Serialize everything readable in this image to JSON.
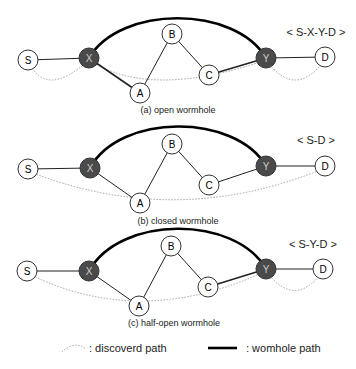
{
  "diagrams": [
    {
      "caption": "(a) open wormhole",
      "route": "< S-X-Y-D >",
      "nodes": {
        "S": {
          "label": "S",
          "x": 28,
          "y": 60,
          "type": "normal"
        },
        "X": {
          "label": "X",
          "x": 89,
          "y": 58,
          "type": "wormhole"
        },
        "A": {
          "label": "A",
          "x": 140,
          "y": 93,
          "type": "normal"
        },
        "B": {
          "label": "B",
          "x": 172,
          "y": 34,
          "type": "normal"
        },
        "C": {
          "label": "C",
          "x": 209,
          "y": 75,
          "type": "normal"
        },
        "Y": {
          "label": "Y",
          "x": 266,
          "y": 58,
          "type": "wormhole"
        },
        "D": {
          "label": "D",
          "x": 325,
          "y": 57,
          "type": "normal"
        }
      },
      "discovered_path": [
        "S",
        "X",
        "Y",
        "D"
      ]
    },
    {
      "caption": "(b) closed wormhole",
      "route": "< S-D >",
      "nodes": {
        "S": {
          "label": "S",
          "x": 28,
          "y": 169,
          "type": "normal"
        },
        "X": {
          "label": "X",
          "x": 90,
          "y": 168,
          "type": "wormhole"
        },
        "A": {
          "label": "A",
          "x": 140,
          "y": 203,
          "type": "normal"
        },
        "B": {
          "label": "B",
          "x": 172,
          "y": 144,
          "type": "normal"
        },
        "C": {
          "label": "C",
          "x": 209,
          "y": 185,
          "type": "normal"
        },
        "Y": {
          "label": "Y",
          "x": 266,
          "y": 166,
          "type": "wormhole"
        },
        "D": {
          "label": "D",
          "x": 325,
          "y": 166,
          "type": "normal"
        }
      },
      "discovered_path": [
        "S",
        "D"
      ]
    },
    {
      "caption": "(c) half-open wormhole",
      "route": "< S-Y-D >",
      "nodes": {
        "S": {
          "label": "S",
          "x": 27,
          "y": 271,
          "type": "normal"
        },
        "X": {
          "label": "X",
          "x": 89,
          "y": 271,
          "type": "wormhole"
        },
        "A": {
          "label": "A",
          "x": 139,
          "y": 306,
          "type": "normal"
        },
        "B": {
          "label": "B",
          "x": 171,
          "y": 246,
          "type": "normal"
        },
        "C": {
          "label": "C",
          "x": 208,
          "y": 287,
          "type": "normal"
        },
        "Y": {
          "label": "Y",
          "x": 266,
          "y": 269,
          "type": "wormhole"
        },
        "D": {
          "label": "D",
          "x": 323,
          "y": 269,
          "type": "normal"
        }
      },
      "discovered_path": [
        "S",
        "Y",
        "D"
      ]
    }
  ],
  "edges": [
    [
      "S",
      "X"
    ],
    [
      "X",
      "A"
    ],
    [
      "A",
      "B"
    ],
    [
      "B",
      "C"
    ],
    [
      "C",
      "Y"
    ],
    [
      "Y",
      "D"
    ]
  ],
  "legend": {
    "discovered_label": ": discoverd path",
    "wormhole_label": ": womhole path"
  },
  "colors": {
    "wormhole_node_fill": "#4a4a4a",
    "normal_node_fill": "#ffffff",
    "edge": "#222222",
    "wormhole_link": "#000000",
    "discovered_path": "#999999"
  }
}
